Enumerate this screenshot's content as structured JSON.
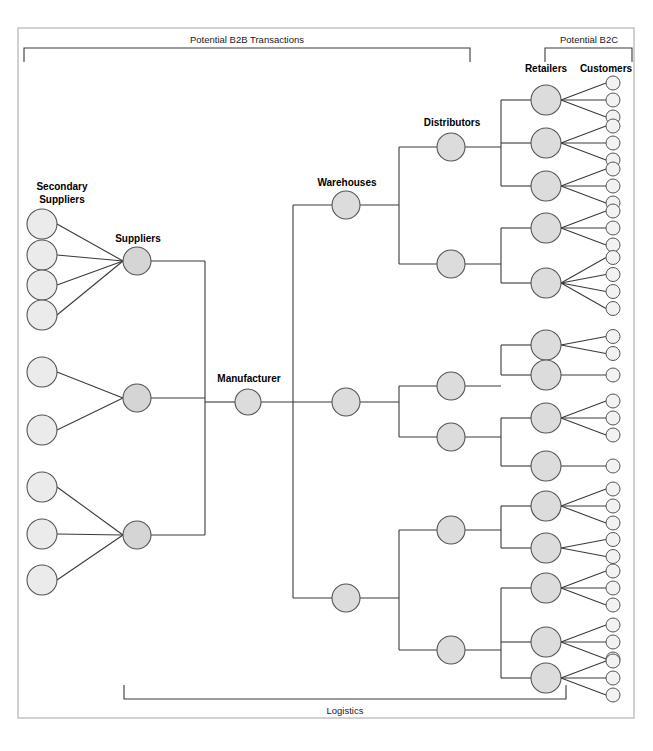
{
  "diagram": {
    "background": "#ffffff",
    "frame": {
      "x": 18,
      "y": 28,
      "w": 616,
      "h": 690,
      "color": "#b9b9b9"
    },
    "node_styles": {
      "light_fill": "#ebebeb",
      "mid_fill": "#dcdcdc",
      "dark_fill": "#cfcfcf",
      "stroke": "#555555",
      "edge_color": "#3a3a3a"
    }
  },
  "brackets": [
    {
      "name": "b2b-bracket",
      "label": "Potential B2B Transactions",
      "x1": 24,
      "x2": 470,
      "y": 48,
      "tick": 14,
      "label_x": 247,
      "label_y": 43,
      "direction": "down"
    },
    {
      "name": "b2c-bracket",
      "label": "Potential B2C",
      "x1": 545,
      "x2": 632,
      "y": 48,
      "tick": 14,
      "label_x": 589,
      "label_y": 43,
      "direction": "down"
    },
    {
      "name": "logistics-bracket",
      "label": "Logistics",
      "x1": 124,
      "x2": 566,
      "y": 699,
      "tick": 14,
      "label_x": 345,
      "label_y": 714,
      "direction": "up"
    }
  ],
  "column_labels": [
    {
      "name": "secondary-suppliers-label",
      "text_line1": "Secondary",
      "text_line2": "Suppliers",
      "x": 62,
      "y": 190
    },
    {
      "name": "suppliers-label",
      "text": "Suppliers",
      "x": 138,
      "y": 242
    },
    {
      "name": "manufacturer-label",
      "text": "Manufacturer",
      "x": 249,
      "y": 382
    },
    {
      "name": "warehouses-label",
      "text": "Warehouses",
      "x": 347,
      "y": 186
    },
    {
      "name": "distributors-label",
      "text": "Distributors",
      "x": 452,
      "y": 126
    },
    {
      "name": "retailers-label",
      "text": "Retailers",
      "x": 546,
      "y": 72
    },
    {
      "name": "customers-label",
      "text": "Customers",
      "x": 606,
      "y": 72
    }
  ],
  "columns": {
    "secondary_suppliers": {
      "label": "Secondary Suppliers",
      "x": 42,
      "radius": 15,
      "fill": "#ebebeb",
      "count": 9,
      "nodes": [
        {
          "id": "ss1",
          "y": 224,
          "parent": "s1"
        },
        {
          "id": "ss2",
          "y": 255,
          "parent": "s1"
        },
        {
          "id": "ss3",
          "y": 285,
          "parent": "s1"
        },
        {
          "id": "ss4",
          "y": 315,
          "parent": "s1"
        },
        {
          "id": "ss5",
          "y": 372,
          "parent": "s2"
        },
        {
          "id": "ss6",
          "y": 430,
          "parent": "s2"
        },
        {
          "id": "ss7",
          "y": 487,
          "parent": "s3"
        },
        {
          "id": "ss8",
          "y": 534,
          "parent": "s3"
        },
        {
          "id": "ss9",
          "y": 580,
          "parent": "s3"
        }
      ]
    },
    "suppliers": {
      "label": "Suppliers",
      "x": 137,
      "radius": 14,
      "fill": "#d5d5d5",
      "count": 3,
      "nodes": [
        {
          "id": "s1",
          "y": 261
        },
        {
          "id": "s2",
          "y": 398
        },
        {
          "id": "s3",
          "y": 535
        }
      ],
      "bus_x": 205
    },
    "manufacturer": {
      "label": "Manufacturer",
      "x": 248,
      "radius": 13,
      "fill": "#dcdcdc",
      "count": 1,
      "nodes": [
        {
          "id": "m1",
          "y": 402
        }
      ]
    },
    "warehouses": {
      "label": "Warehouses",
      "x": 346,
      "radius": 14,
      "fill": "#dcdcdc",
      "count": 3,
      "nodes": [
        {
          "id": "w1",
          "y": 205
        },
        {
          "id": "w2",
          "y": 402
        },
        {
          "id": "w3",
          "y": 598
        }
      ],
      "bus_x": 293
    },
    "distributors": {
      "label": "Distributors",
      "x": 451,
      "radius": 14,
      "fill": "#dcdcdc",
      "count": 6,
      "nodes": [
        {
          "id": "d1",
          "y": 147,
          "parent": "w1"
        },
        {
          "id": "d2",
          "y": 264,
          "parent": "w1"
        },
        {
          "id": "d3",
          "y": 386,
          "parent": "w2"
        },
        {
          "id": "d4",
          "y": 437,
          "parent": "w2"
        },
        {
          "id": "d5",
          "y": 530,
          "parent": "w3"
        },
        {
          "id": "d6",
          "y": 650,
          "parent": "w3"
        }
      ],
      "bus_offset": 53
    },
    "retailers": {
      "label": "Retailers",
      "x": 546,
      "radius": 15,
      "fill": "#dcdcdc",
      "count": 14,
      "nodes": [
        {
          "id": "r1",
          "y": 100,
          "parent": "d1",
          "customers": 3
        },
        {
          "id": "r2",
          "y": 143,
          "parent": "d1",
          "customers": 3
        },
        {
          "id": "r3",
          "y": 186,
          "parent": "d1",
          "customers": 3
        },
        {
          "id": "r4",
          "y": 228,
          "parent": "d2",
          "customers": 3
        },
        {
          "id": "r5",
          "y": 283,
          "parent": "d2",
          "customers": 4
        },
        {
          "id": "r6",
          "y": 345,
          "parent": "d3",
          "customers": 2
        },
        {
          "id": "r7",
          "y": 375,
          "parent": "d3",
          "customers": 1
        },
        {
          "id": "r8",
          "y": 418,
          "parent": "d4",
          "customers": 3
        },
        {
          "id": "r9",
          "y": 466,
          "parent": "d4",
          "customers": 1
        },
        {
          "id": "r10",
          "y": 506,
          "parent": "d5",
          "customers": 3
        },
        {
          "id": "r11",
          "y": 548,
          "parent": "d5",
          "customers": 2
        },
        {
          "id": "r12",
          "y": 588,
          "parent": "d6",
          "customers": 3
        },
        {
          "id": "r13",
          "y": 642,
          "parent": "d6",
          "customers": 3
        },
        {
          "id": "r14",
          "y": 678,
          "parent": "d6",
          "customers": 3
        }
      ],
      "bus_offset": 50
    },
    "customers": {
      "label": "Customers",
      "x": 613,
      "radius": 7,
      "fill": "#f2f2f2",
      "count": 37,
      "spacing": 17
    }
  },
  "summary": {
    "secondary_supplier_count": 9,
    "supplier_count": 3,
    "manufacturer_count": 1,
    "warehouse_count": 3,
    "distributor_count": 6,
    "retailer_count": 14,
    "customer_count": 37
  }
}
